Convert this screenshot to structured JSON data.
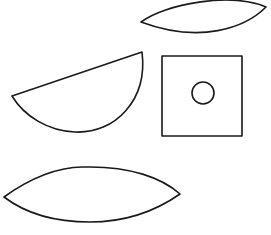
{
  "canvas": {
    "width": 271,
    "height": 235,
    "background": "#ffffff",
    "stroke_color": "#1a1a1a"
  },
  "shapes": [
    {
      "id": "top-lens",
      "type": "lens",
      "description": "Lens/leaf shape at top right"
    },
    {
      "id": "half-disk",
      "type": "half-disk",
      "description": "Semicircular segment, tilted, at left middle"
    },
    {
      "id": "square-with-circle",
      "type": "square",
      "description": "Square with small circle inside, right middle"
    },
    {
      "id": "bottom-lens",
      "type": "lens",
      "description": "Large lens/leaf shape at bottom left"
    }
  ]
}
